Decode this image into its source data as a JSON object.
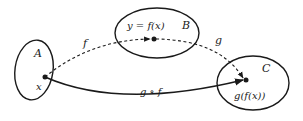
{
  "diagram": {
    "type": "function-composition",
    "sets": [
      {
        "id": "A",
        "label": "A"
      },
      {
        "id": "B",
        "label": "B"
      },
      {
        "id": "C",
        "label": "C"
      }
    ],
    "points": [
      {
        "id": "x",
        "label": "x",
        "set": "A"
      },
      {
        "id": "y",
        "label": "y = f(x)",
        "set": "B"
      },
      {
        "id": "gfx",
        "label": "g(f(x))",
        "set": "C"
      }
    ],
    "arrows": [
      {
        "id": "f",
        "label": "f",
        "from": "x",
        "to": "y",
        "style": "dashed"
      },
      {
        "id": "g",
        "label": "g",
        "from": "y",
        "to": "gfx",
        "style": "dashed"
      },
      {
        "id": "gof",
        "label": "g ∘ f",
        "from": "x",
        "to": "gfx",
        "style": "solid"
      }
    ],
    "colors": {
      "stroke": "#1a1a1a",
      "background": "#ffffff"
    }
  }
}
